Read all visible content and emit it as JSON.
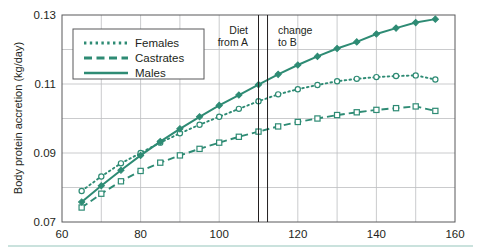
{
  "chart_data": {
    "type": "line",
    "title": "",
    "xlabel": "",
    "ylabel": "Body protein accretion (kg/day)",
    "xlim": [
      60,
      160
    ],
    "ylim": [
      0.07,
      0.13
    ],
    "xticks": [
      60,
      80,
      100,
      120,
      140,
      160
    ],
    "xtick_labels": [
      "60",
      "80",
      "100",
      "120",
      "140",
      "160"
    ],
    "yticks": [
      0.07,
      0.09,
      0.11,
      0.13
    ],
    "ytick_labels": [
      "0.07",
      "0.09",
      "0.11",
      "0.13"
    ],
    "x_minor_step": 10,
    "y_minor_step": 0.005,
    "grid": true,
    "legend_position": "upper-left",
    "line_color": "#2e8b74",
    "x": [
      65,
      70,
      75,
      80,
      85,
      90,
      95,
      100,
      105,
      110,
      115,
      120,
      125,
      130,
      135,
      140,
      145,
      150,
      155
    ],
    "series": [
      {
        "name": "Females",
        "style": "dotted",
        "marker": "open-circle",
        "values": [
          0.079,
          0.0832,
          0.087,
          0.09,
          0.093,
          0.0957,
          0.0982,
          0.1005,
          0.1028,
          0.105,
          0.107,
          0.1085,
          0.1097,
          0.1108,
          0.1115,
          0.112,
          0.1123,
          0.1125,
          0.1113
        ]
      },
      {
        "name": "Castrates",
        "style": "dashed",
        "marker": "open-square",
        "values": [
          0.0742,
          0.0782,
          0.0818,
          0.0848,
          0.0872,
          0.0893,
          0.0912,
          0.093,
          0.0947,
          0.0962,
          0.0977,
          0.099,
          0.1,
          0.101,
          0.1018,
          0.1025,
          0.103,
          0.1035,
          0.1022
        ]
      },
      {
        "name": "Males",
        "style": "solid",
        "marker": "filled-diamond",
        "values": [
          0.0758,
          0.0805,
          0.085,
          0.0893,
          0.0933,
          0.097,
          0.1005,
          0.1038,
          0.1068,
          0.1098,
          0.1128,
          0.1155,
          0.118,
          0.1203,
          0.1222,
          0.1245,
          0.1262,
          0.1278,
          0.1288
        ]
      }
    ],
    "annotations": [
      {
        "name": "diet-change-line-a",
        "type": "vline",
        "x": 110.0
      },
      {
        "name": "diet-change-line-b",
        "type": "vline",
        "x": 112.3
      },
      {
        "name": "diet-from-a-label",
        "type": "text",
        "line1": "Diet",
        "line2": "from A"
      },
      {
        "name": "change-to-b-label",
        "type": "text",
        "line1": "change",
        "line2": "to B"
      }
    ]
  },
  "legend": {
    "items": [
      {
        "label": "Females"
      },
      {
        "label": "Castrates"
      },
      {
        "label": "Males"
      }
    ]
  },
  "colors": {
    "series": "#2e8b74",
    "axis": "#58595b",
    "grid": "#bcbec0",
    "text": "#231f20",
    "footer_rule": "#b8d8d2"
  }
}
